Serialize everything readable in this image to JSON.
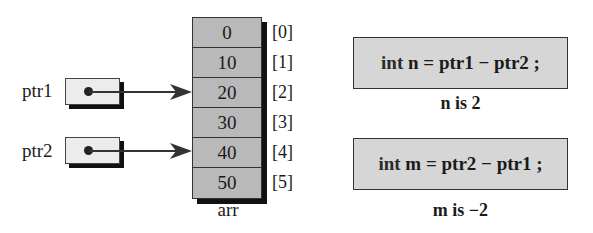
{
  "array": {
    "name": "arr",
    "cells": [
      {
        "value": "0",
        "index": "[0]"
      },
      {
        "value": "10",
        "index": "[1]"
      },
      {
        "value": "20",
        "index": "[2]"
      },
      {
        "value": "30",
        "index": "[3]"
      },
      {
        "value": "40",
        "index": "[4]"
      },
      {
        "value": "50",
        "index": "[5]"
      }
    ]
  },
  "pointers": [
    {
      "name": "ptr1",
      "points_to_index": 2
    },
    {
      "name": "ptr2",
      "points_to_index": 4
    }
  ],
  "statements": [
    {
      "keyword": "int",
      "code": "n = ptr1 − ptr2 ;",
      "result": "n is 2"
    },
    {
      "keyword": "int",
      "code": "m = ptr2 − ptr1 ;",
      "result": "m is −2"
    }
  ],
  "colors": {
    "array_fill": "#b9b9b9",
    "pointer_fill": "#ececec",
    "code_fill": "#d6d6d6",
    "shadow": "#111111",
    "ink": "#1a1a1a"
  }
}
